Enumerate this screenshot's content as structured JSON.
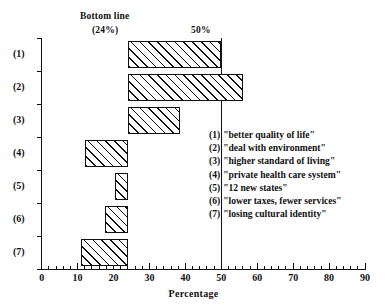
{
  "chart_data": {
    "type": "bar",
    "orientation": "horizontal",
    "title": "",
    "xlabel": "Percentage",
    "ylabel": "",
    "xlim": [
      0,
      90
    ],
    "xticks": [
      0,
      10,
      20,
      30,
      40,
      50,
      60,
      70,
      80,
      90
    ],
    "xtick_labels": [
      "0",
      "10",
      "20",
      "30",
      "40",
      "50",
      "60",
      "70",
      "80",
      "90"
    ],
    "minor_tick_step": 2,
    "grid": false,
    "legend_position": "right-inside",
    "baseline": 24,
    "categories": [
      "(1)",
      "(2)",
      "(3)",
      "(4)",
      "(5)",
      "(6)",
      "(7)"
    ],
    "bars": [
      {
        "category": "(1)",
        "start": 24,
        "end": 50,
        "length": 26.0
      },
      {
        "category": "(2)",
        "start": 24,
        "end": 56,
        "length": 32.0
      },
      {
        "category": "(3)",
        "start": 24,
        "end": 38.5,
        "length": 14.5
      },
      {
        "category": "(4)",
        "start": 12,
        "end": 24,
        "length": 12.0
      },
      {
        "category": "(5)",
        "start": 20.5,
        "end": 24,
        "length": 3.5
      },
      {
        "category": "(6)",
        "start": 17.5,
        "end": 24,
        "length": 6.5
      },
      {
        "category": "(7)",
        "start": 11,
        "end": 24,
        "length": 13.0
      }
    ],
    "values": [
      50,
      56,
      38.5,
      12,
      20.5,
      17.5,
      11
    ],
    "reference_lines": [
      {
        "name": "bottom-line",
        "value": 24,
        "label": "Bottom line",
        "sublabel": "(24%)",
        "drawn": false
      },
      {
        "name": "fifty-percent",
        "value": 50,
        "label": "50%",
        "drawn": true
      }
    ],
    "annotations": [
      {
        "name": "bottom-line-label",
        "text": "Bottom line"
      },
      {
        "name": "bottom-line-value",
        "text": "(24%)"
      },
      {
        "name": "fifty-percent-label",
        "text": "50%"
      }
    ],
    "legend_entries": [
      {
        "key": "(1)",
        "label": "\"better quality of life\""
      },
      {
        "key": "(2)",
        "label": "\"deal with environment\""
      },
      {
        "key": "(3)",
        "label": "\"higher standard of living\""
      },
      {
        "key": "(4)",
        "label": "\"private health care system\""
      },
      {
        "key": "(5)",
        "label": "\"12 new states\""
      },
      {
        "key": "(6)",
        "label": "\"lower taxes, fewer services\""
      },
      {
        "key": "(7)",
        "label": "\"losing cultural identity\""
      }
    ],
    "colors": {
      "ink": "#111111",
      "background": "#ffffff",
      "bar_fill": "#ffffff",
      "bar_hatch": "#111111"
    }
  }
}
